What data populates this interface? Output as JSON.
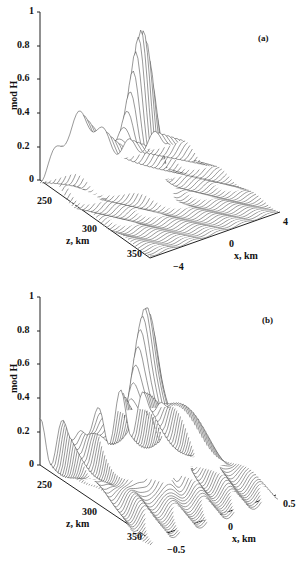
{
  "chart_data": [
    {
      "type": "surface3d",
      "panel": "(a)",
      "title": "",
      "zlabel": "mod H",
      "ylabel": "z, km",
      "xlabel": "x, km",
      "z_axis_ticks": [
        "0",
        "0.2",
        "0.4",
        "0.6",
        "0.8",
        "1"
      ],
      "zlim": [
        0,
        1
      ],
      "depth_axis_ticks": [
        "250",
        "300",
        "350"
      ],
      "x_axis_ticks": [
        "-4",
        "0",
        "4"
      ],
      "xlim": [
        -4,
        4
      ],
      "peak": {
        "x": 0,
        "z_km": 300,
        "value": 0.9
      },
      "plateau_level": 0.3,
      "description": "Wireframe surface with sharp central peak ~0.9 near x=0, ridge ~0.3 at far edge, decaying ripples"
    },
    {
      "type": "surface3d",
      "panel": "(b)",
      "title": "",
      "zlabel": "mod H",
      "ylabel": "z, km",
      "xlabel": "x, km",
      "z_axis_ticks": [
        "0",
        "0.2",
        "0.4",
        "0.6",
        "0.8",
        "1"
      ],
      "zlim": [
        0,
        1
      ],
      "depth_axis_ticks": [
        "250",
        "300",
        "350"
      ],
      "x_axis_ticks": [
        "-0.5",
        "0",
        "0.5"
      ],
      "xlim": [
        -0.5,
        0.5
      ],
      "peak": {
        "x": 0,
        "z_km": 300,
        "value": 0.9
      },
      "plateau_level": 0.2,
      "description": "Zoomed wireframe surface with central peak ~0.9 and oscillating side ripples"
    }
  ],
  "panels": [
    {
      "tag": "(a)",
      "ylabel": "mod H",
      "zticks": [
        "1",
        "0.8",
        "0.6",
        "0.4",
        "0.2",
        "0"
      ],
      "depth_ticks": [
        "250",
        "300",
        "350"
      ],
      "depth_label": "z, km",
      "x_ticks": [
        "4",
        "0",
        "−4"
      ],
      "x_label": "x, km"
    },
    {
      "tag": "(b)",
      "ylabel": "mod H",
      "zticks": [
        "1",
        "0.8",
        "0.6",
        "0.4",
        "0.2",
        "0"
      ],
      "depth_ticks": [
        "250",
        "300",
        "350"
      ],
      "depth_label": "z, km",
      "x_ticks": [
        "0.5",
        "0",
        "−0.5"
      ],
      "x_label": "x, km"
    }
  ]
}
